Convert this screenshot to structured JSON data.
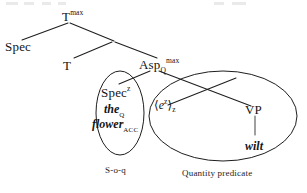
{
  "figure": {
    "type": "syntax-tree",
    "kind": "X-bar phrase structure tree with constituent ellipses",
    "ink_color": "#141414",
    "background_color": "#ffffff"
  },
  "nodes": {
    "tmax": {
      "base": "T",
      "sup": "max",
      "sub": ""
    },
    "spec_top": {
      "base": "Spec",
      "sup": "",
      "sub": ""
    },
    "t_head": {
      "base": "T",
      "sup": "",
      "sub": ""
    },
    "asp_max": {
      "base": "Asp",
      "sub": "Q",
      "sup": "max"
    },
    "spec_inner": {
      "base": "Spec",
      "sup": "z",
      "sub": ""
    },
    "vp": {
      "base": "VP",
      "sup": "",
      "sub": ""
    },
    "trace": {
      "open": "⟨",
      "base": "e",
      "sup": "z",
      "close": "⟩",
      "sub": "z"
    }
  },
  "lexical": {
    "determiner": {
      "word": "the",
      "sub": "Q"
    },
    "noun": {
      "word": "flower",
      "sub": "ACC"
    },
    "verb": {
      "word": "wilt",
      "sub": ""
    }
  },
  "captions": {
    "left_ellipse": "S-o-q",
    "right_ellipse": "Quantity predicate"
  }
}
